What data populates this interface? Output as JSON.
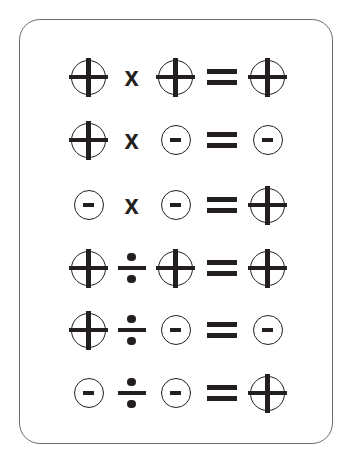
{
  "card": {
    "border_color": "#6b6d70",
    "background_color": "#ffffff",
    "ink_color": "#231f20"
  },
  "chart_title": "",
  "symbols": {
    "plus": "+",
    "minus": "-",
    "times": "x",
    "divide": "÷",
    "equals": "="
  },
  "rows": [
    {
      "operand_a": "+",
      "operator": "x",
      "operand_b": "+",
      "equals": "=",
      "result": "+",
      "reading": "positive times positive equals positive"
    },
    {
      "operand_a": "+",
      "operator": "x",
      "operand_b": "-",
      "equals": "=",
      "result": "-",
      "reading": "positive times negative equals negative"
    },
    {
      "operand_a": "-",
      "operator": "x",
      "operand_b": "-",
      "equals": "=",
      "result": "+",
      "reading": "negative times negative equals positive"
    },
    {
      "operand_a": "+",
      "operator": "÷",
      "operand_b": "+",
      "equals": "=",
      "result": "+",
      "reading": "positive divided by positive equals positive"
    },
    {
      "operand_a": "+",
      "operator": "÷",
      "operand_b": "-",
      "equals": "=",
      "result": "-",
      "reading": "positive divided by negative equals negative"
    },
    {
      "operand_a": "-",
      "operator": "÷",
      "operand_b": "-",
      "equals": "=",
      "result": "+",
      "reading": "negative divided by negative equals positive"
    }
  ]
}
